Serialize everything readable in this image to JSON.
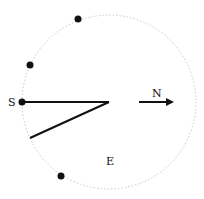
{
  "diagram": {
    "type": "geometry-figure",
    "circle": {
      "cx": 109,
      "cy": 102,
      "r": 87,
      "stroke": "#c8c8c8",
      "style": "dotted"
    },
    "points": [
      {
        "id": "p1",
        "x": 78,
        "y": 19
      },
      {
        "id": "p2",
        "x": 30,
        "y": 65
      },
      {
        "id": "S",
        "x": 22,
        "y": 102
      },
      {
        "id": "p4",
        "x": 61,
        "y": 176
      }
    ],
    "segments": [
      {
        "id": "seg-S-center",
        "x1": 22,
        "y1": 102,
        "x2": 109,
        "y2": 102
      },
      {
        "id": "seg-center-lower",
        "x1": 109,
        "y1": 102,
        "x2": 30,
        "y2": 138
      }
    ],
    "arrow": {
      "x1": 139,
      "y1": 102,
      "x2": 176,
      "y2": 102,
      "label": "N"
    },
    "labels": {
      "S": "S",
      "N": "N",
      "E": "E"
    },
    "colors": {
      "ink": "#111111",
      "circle": "#c8c8c8"
    }
  }
}
